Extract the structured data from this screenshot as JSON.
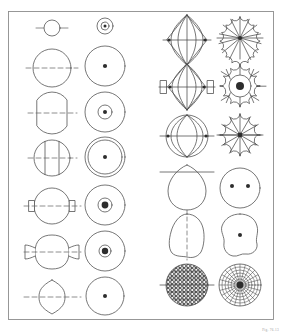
{
  "plate": {
    "title": "Bead form typology plate",
    "description": "Line-drawing plate of bead and spindle-whorl forms; each entry shows a profile (side elevation with perforation axis) beside its corresponding plan or section view.",
    "caption": "Fig. 76.13",
    "colors": {
      "background": "#ffffff",
      "ink": "#4a4a4a",
      "ink_dark": "#2d2d2d",
      "frame": "#8d8d8d",
      "fill": "#ffffff",
      "caption": "#9a9a9a"
    },
    "frame": {
      "x": 8,
      "y": 11,
      "width": 265,
      "height": 309,
      "stroke_width": 0.9
    },
    "columns": [
      {
        "name": "left-profile-column",
        "label": "Profile view",
        "cx": 52
      },
      {
        "name": "left-plan-column",
        "label": "Plan view",
        "cx": 105
      },
      {
        "name": "right-profile-column",
        "label": "Profile view",
        "cx": 187
      },
      {
        "name": "right-plan-column",
        "label": "Plan view",
        "cx": 240
      }
    ],
    "figures": [
      {
        "id": "fig-1",
        "row": 1,
        "half": "left",
        "profile": {
          "name": "small-annular-bead-profile",
          "shape": "circle",
          "cx": 52,
          "cy": 28,
          "r": 8,
          "axis": {
            "type": "solid",
            "x1": 36,
            "x2": 68,
            "y": 28
          },
          "note": "small ring bead, short perforation axis"
        },
        "plan": {
          "name": "small-annular-bead-plan",
          "shape": "circle-with-ring-and-dot",
          "cx": 105,
          "cy": 26,
          "r": 8,
          "inner_r": 4,
          "dot_r": 1.5
        }
      },
      {
        "id": "fig-2",
        "row": 2,
        "half": "left",
        "profile": {
          "name": "globular-bead-profile",
          "shape": "circle",
          "cx": 52,
          "cy": 68,
          "r": 19,
          "axis": {
            "type": "dashed",
            "x1": 26,
            "x2": 78,
            "y": 68
          }
        },
        "plan": {
          "name": "globular-bead-plan",
          "shape": "circle-with-dot",
          "cx": 105,
          "cy": 66,
          "r": 20,
          "dot_r": 2.1
        }
      },
      {
        "id": "fig-3",
        "row": 3,
        "half": "left",
        "profile": {
          "name": "flattened-globular-bead-profile",
          "shape": "circle-flat-top-bottom",
          "cx": 52,
          "cy": 113,
          "r": 18,
          "flat": 3,
          "axis": {
            "type": "dashed",
            "x1": 28,
            "x2": 77,
            "y": 113
          }
        },
        "plan": {
          "name": "flattened-globular-bead-plan",
          "shape": "circle-with-ring-and-dot",
          "cx": 105,
          "cy": 112,
          "r": 20,
          "inner_r": 7,
          "dot_r": 2
        }
      },
      {
        "id": "fig-4",
        "row": 4,
        "half": "left",
        "profile": {
          "name": "faceted-barrel-bead-profile",
          "shape": "circle-with-two-vertical-chords",
          "cx": 52,
          "cy": 158,
          "r": 18,
          "chord_offset": 7,
          "axis": {
            "type": "dashed",
            "x1": 28,
            "x2": 77,
            "y": 158
          }
        },
        "plan": {
          "name": "faceted-barrel-bead-plan",
          "shape": "double-circle-with-dot",
          "cx": 105,
          "cy": 157,
          "r": 20,
          "inner_r": 17,
          "dot_r": 2
        }
      },
      {
        "id": "fig-5",
        "row": 5,
        "half": "left",
        "profile": {
          "name": "collared-globular-bead-profile",
          "shape": "circle-with-end-collars",
          "cx": 52,
          "cy": 206,
          "r": 18,
          "collar": {
            "width": 5,
            "height": 11
          },
          "axis": {
            "type": "dashed",
            "x1": 24,
            "x2": 81,
            "y": 206
          }
        },
        "plan": {
          "name": "collared-globular-bead-plan",
          "shape": "circle-with-ring-and-bold-dot",
          "cx": 105,
          "cy": 205,
          "r": 20,
          "inner_r": 7,
          "dot_r": 3.4
        }
      },
      {
        "id": "fig-6",
        "row": 6,
        "half": "left",
        "profile": {
          "name": "lobed-globular-bead-profile",
          "shape": "circle-with-lateral-lobes",
          "cx": 52,
          "cy": 252,
          "r": 17,
          "axis": {
            "type": "dashed",
            "x1": 24,
            "x2": 81,
            "y": 252
          }
        },
        "plan": {
          "name": "lobed-globular-bead-plan",
          "shape": "circle-with-ring-and-bold-dot",
          "cx": 105,
          "cy": 251,
          "r": 20,
          "inner_r": 6,
          "dot_r": 3.2
        }
      },
      {
        "id": "fig-7",
        "row": 7,
        "half": "left",
        "profile": {
          "name": "lentoid-bead-profile",
          "shape": "lens",
          "cx": 52,
          "cy": 297,
          "rx": 13,
          "ry": 17,
          "axis": {
            "type": "dashed",
            "x1": 24,
            "x2": 81,
            "y": 297
          }
        },
        "plan": {
          "name": "lentoid-bead-plan",
          "shape": "circle-with-dot",
          "cx": 105,
          "cy": 296,
          "r": 19,
          "dot_r": 2
        }
      },
      {
        "id": "fig-8",
        "row": 1,
        "half": "right",
        "profile": {
          "name": "ribbed-bicone-bead-profile",
          "shape": "bicone-ribbed",
          "cx": 187,
          "cy": 40,
          "rx": 20,
          "ry": 25,
          "ribs": 4,
          "axis": {
            "type": "solid",
            "x1": 163,
            "x2": 211,
            "y": 40
          }
        },
        "plan": {
          "name": "ribbed-bicone-bead-plan",
          "shape": "scalloped-rosette",
          "cx": 240,
          "cy": 38,
          "r": 21,
          "petals": 14,
          "dot_r": 2
        }
      },
      {
        "id": "fig-9",
        "row": 2,
        "half": "right",
        "profile": {
          "name": "collared-ribbed-bicone-profile",
          "shape": "bicone-ribbed-with-collars",
          "cx": 187,
          "cy": 87,
          "rx": 19,
          "ry": 23,
          "ribs": 4,
          "collar": {
            "width": 6,
            "height": 13
          },
          "axis": {
            "type": "solid",
            "x1": 159,
            "x2": 215,
            "y": 87
          }
        },
        "plan": {
          "name": "collared-ribbed-bicone-plan",
          "shape": "scalloped-rosette-bold-hub",
          "cx": 240,
          "cy": 86,
          "r": 21,
          "petals": 12,
          "dot_r": 4
        }
      },
      {
        "id": "fig-10",
        "row": 3,
        "half": "right",
        "profile": {
          "name": "melon-bead-profile",
          "shape": "sphere-ribbed",
          "cx": 187,
          "cy": 136,
          "r": 21,
          "ribs": 4,
          "axis": {
            "type": "solid",
            "x1": 160,
            "x2": 214,
            "y": 136
          }
        },
        "plan": {
          "name": "melon-bead-plan",
          "shape": "scalloped-rosette",
          "cx": 240,
          "cy": 135,
          "r": 21,
          "petals": 12,
          "dot_r": 2.4
        }
      },
      {
        "id": "fig-11",
        "row": 4,
        "half": "right",
        "profile": {
          "name": "teardrop-pendant-profile",
          "shape": "teardrop-flat-top",
          "cx": 187,
          "cy": 187,
          "rx": 19,
          "ry": 22,
          "axis": {
            "type": "solid",
            "x1": 160,
            "x2": 214,
            "y": 172
          }
        },
        "plan": {
          "name": "teardrop-pendant-plan",
          "shape": "circle-with-two-dots",
          "cx": 240,
          "cy": 188,
          "r": 20,
          "dot_r": 2,
          "dot_offset": 8
        }
      },
      {
        "id": "fig-12",
        "row": 5,
        "half": "right",
        "profile": {
          "name": "irregular-nodule-profile",
          "shape": "irregular-blob",
          "cx": 187,
          "cy": 234,
          "r": 19,
          "axis": {
            "type": "dashed",
            "x1": 187,
            "y1": 210,
            "y2": 258,
            "orientation": "vertical"
          }
        },
        "plan": {
          "name": "irregular-nodule-plan",
          "shape": "irregular-blob-with-dot",
          "cx": 240,
          "cy": 234,
          "r": 19,
          "dot_r": 2
        }
      },
      {
        "id": "fig-13",
        "row": 6,
        "half": "right",
        "profile": {
          "name": "lattice-textured-bead-profile",
          "shape": "circle-crosshatch-fill",
          "cx": 187,
          "cy": 285,
          "r": 21,
          "axis": {
            "type": "solid",
            "x1": 160,
            "x2": 214,
            "y": 285
          }
        },
        "plan": {
          "name": "lattice-textured-bead-plan",
          "shape": "radial-web-grid",
          "cx": 240,
          "cy": 285,
          "r": 21,
          "rings": 6,
          "spokes": 18,
          "hub_r": 3.4
        }
      }
    ]
  }
}
